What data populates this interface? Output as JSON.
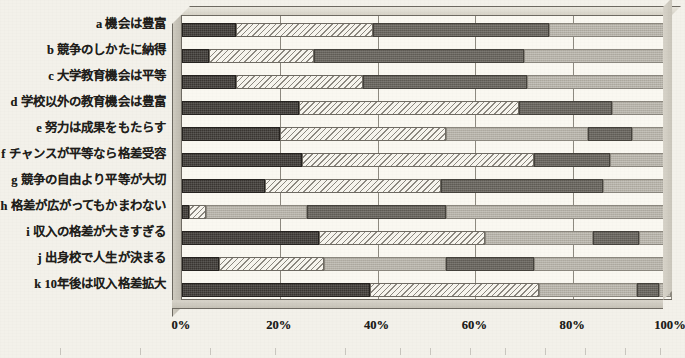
{
  "chart_data": {
    "type": "bar",
    "subtype": "stacked-horizontal-100-percent",
    "title": "",
    "xlabel": "",
    "ylabel": "",
    "xlim": [
      0,
      100
    ],
    "xticks": [
      "0%",
      "20%",
      "40%",
      "60%",
      "80%",
      "100%"
    ],
    "xtick_values": [
      0,
      20,
      40,
      60,
      80,
      100
    ],
    "grid": true,
    "legend": "none",
    "orientation": "horizontal",
    "categories": [
      "a 機会は豊富",
      "b 競争のしかたに納得",
      "c 大学教育機会は平等",
      "d 学校以外の教育機会は豊富",
      "e 努力は成果をもたらす",
      "f チャンスが平等なら格差受容",
      "g 競争の自由より平等が大切",
      "h 格差が広がってもかまわない",
      "i 収入の格差が大きすぎる",
      "j 出身校で人生が決まる",
      "k 10年後は収入格差拡大"
    ],
    "series": [
      {
        "name": "series-1",
        "pattern": "dark",
        "values": [
          11.0,
          5.5,
          11.0,
          24.0,
          20.0,
          24.5,
          17.0,
          1.5,
          28.0,
          7.5,
          38.5
        ]
      },
      {
        "name": "series-2",
        "pattern": "hatch",
        "values": [
          28.0,
          21.5,
          26.0,
          45.0,
          34.0,
          47.5,
          36.0,
          3.5,
          34.0,
          21.5,
          34.5
        ]
      },
      {
        "name": "series-3",
        "pattern": "midgray",
        "values": [
          36.0,
          43.0,
          33.5,
          19.0,
          0.0,
          15.5,
          33.0,
          0.0,
          0.0,
          0.0,
          0.0
        ]
      },
      {
        "name": "series-4",
        "pattern": "light",
        "values": [
          25.0,
          30.0,
          29.5,
          12.0,
          29.0,
          12.5,
          14.0,
          20.5,
          22.0,
          25.0,
          20.0
        ]
      },
      {
        "name": "series-5",
        "pattern": "midgray",
        "values": [
          0.0,
          0.0,
          0.0,
          0.0,
          9.0,
          0.0,
          0.0,
          28.5,
          9.5,
          18.0,
          4.5
        ]
      },
      {
        "name": "series-6",
        "pattern": "light",
        "values": [
          0.0,
          0.0,
          0.0,
          0.0,
          8.0,
          0.0,
          0.0,
          46.0,
          6.5,
          28.0,
          2.5
        ]
      }
    ],
    "colors": {
      "dark": "#3a3632",
      "hatch": "#f7f5ee",
      "midgray": "#6a665f",
      "light": "#b6b2a8",
      "plot_background": "#faf8f1",
      "frame": "#6e6a62",
      "page_background": "#f3f1ea"
    }
  }
}
